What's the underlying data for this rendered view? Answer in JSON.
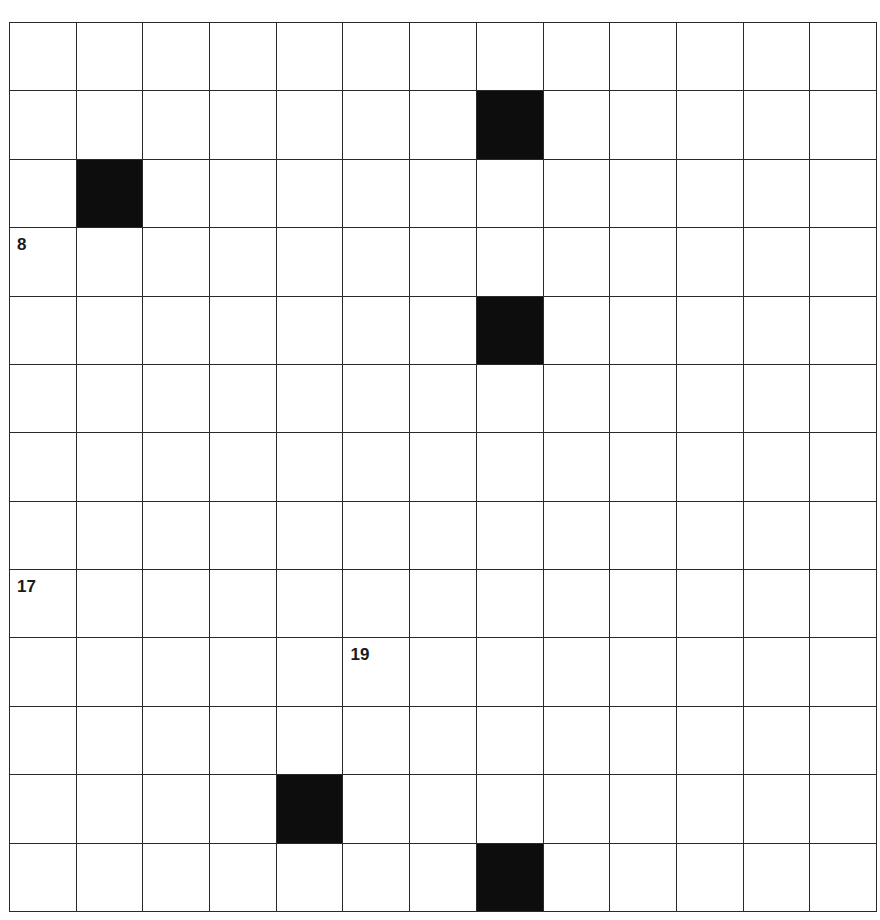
{
  "puzzle": {
    "rows": 13,
    "cols": 13,
    "colors": {
      "cell": "#ffffff",
      "block": "#0d0d0d",
      "line": "#2a2a2a",
      "number": "#1a1a1a"
    },
    "blocks": [
      [
        1,
        7
      ],
      [
        2,
        1
      ],
      [
        4,
        7
      ],
      [
        11,
        4
      ],
      [
        12,
        7
      ]
    ],
    "numbers": [
      {
        "row": 3,
        "col": 0,
        "label": "8"
      },
      {
        "row": 8,
        "col": 0,
        "label": "17"
      },
      {
        "row": 9,
        "col": 5,
        "label": "19"
      }
    ]
  }
}
